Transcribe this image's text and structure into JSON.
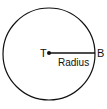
{
  "diagram": {
    "shape": "circle",
    "center_point": {
      "label": "T"
    },
    "edge_point": {
      "label": "B"
    },
    "segment_label": "Radius",
    "stroke_color": "#111111",
    "background_color": "#ffffff"
  }
}
